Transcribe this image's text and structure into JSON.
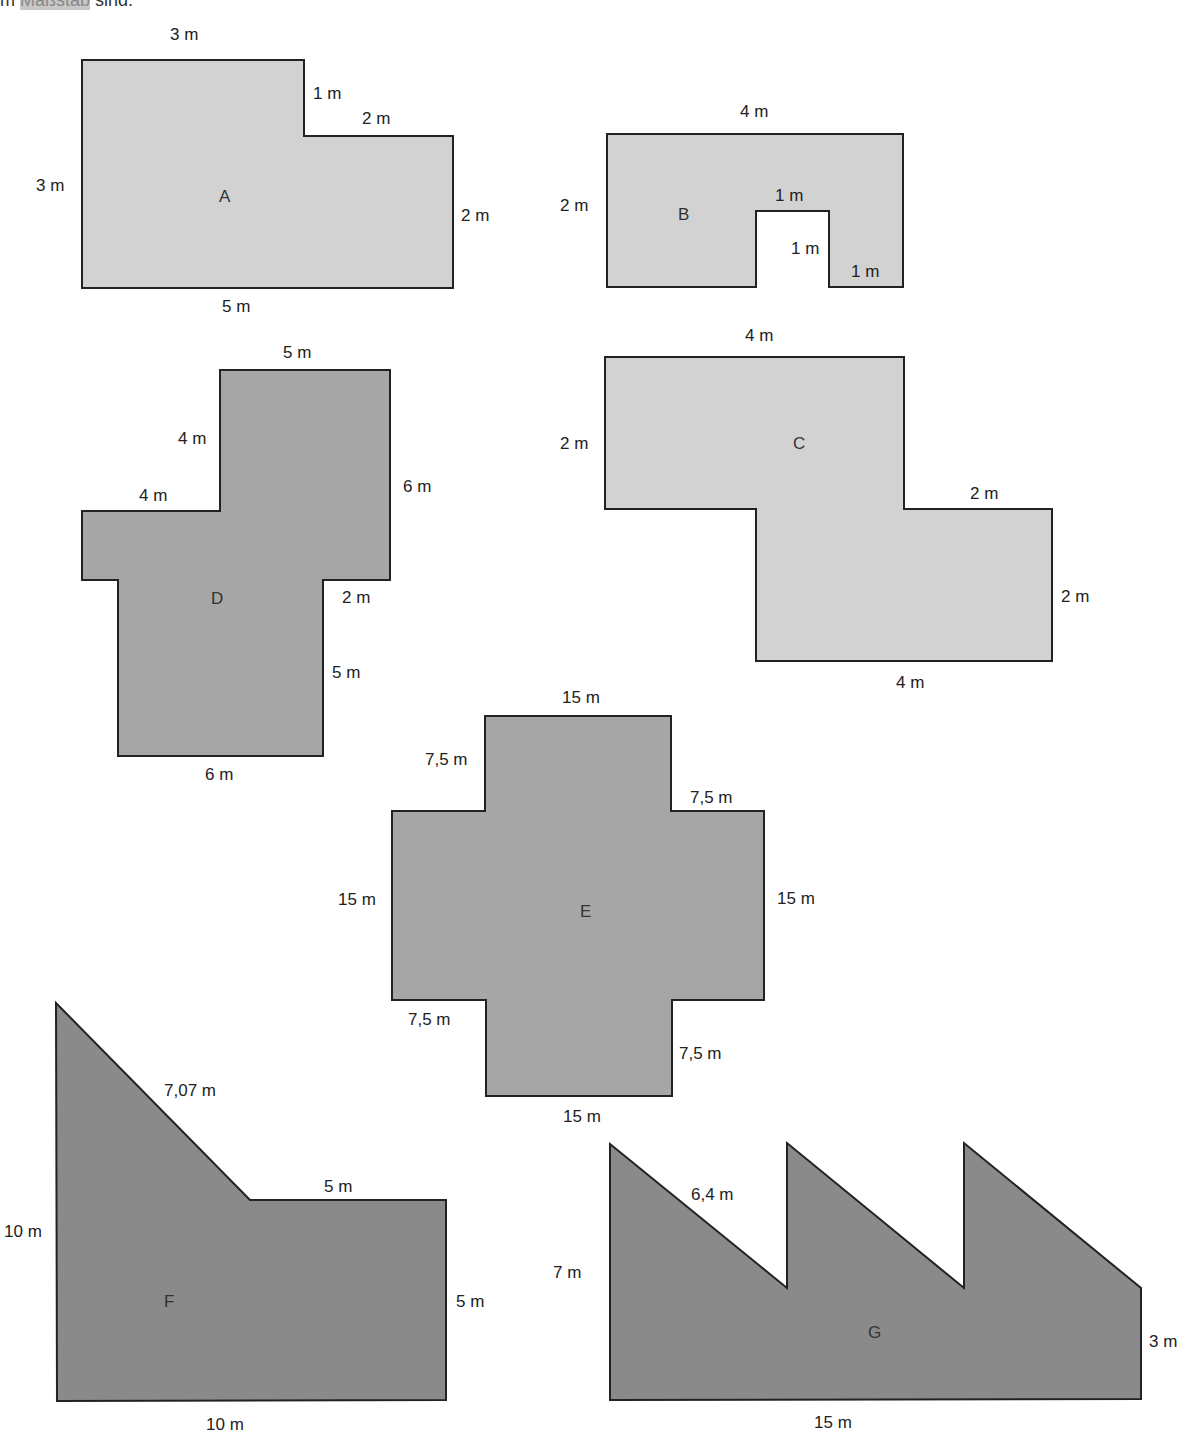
{
  "header": {
    "prefix": "m",
    "highlight": "Maßstab",
    "suffix": "sind."
  },
  "colors": {
    "light": "#d2d2d2",
    "medium": "#a6a6a6",
    "dark": "#8a8a8a",
    "stroke": "#222222"
  },
  "shapes": {
    "A": {
      "name": "A",
      "labels": {
        "top": "3 m",
        "step_vertical": "1 m",
        "step_horizontal": "2 m",
        "left": "3 m",
        "right": "2 m",
        "bottom": "5 m"
      }
    },
    "B": {
      "name": "B",
      "labels": {
        "top": "4 m",
        "left": "2 m",
        "notch_top": "1 m",
        "notch_side": "1 m",
        "bottom_right": "1 m"
      }
    },
    "C": {
      "name": "C",
      "labels": {
        "top": "4 m",
        "left": "2 m",
        "step_horizontal": "2 m",
        "right": "2 m",
        "bottom": "4 m"
      }
    },
    "D": {
      "name": "D",
      "labels": {
        "top": "5 m",
        "upper_left_vertical": "4 m",
        "left_horizontal": "4 m",
        "right": "6 m",
        "right_step": "2 m",
        "lower_right": "5 m",
        "bottom": "6 m"
      }
    },
    "E": {
      "name": "E",
      "labels": {
        "top": "15 m",
        "top_left": "7,5 m",
        "top_right": "7,5 m",
        "left": "15 m",
        "right": "15 m",
        "bottom_left": "7,5 m",
        "bottom_right": "7,5 m",
        "bottom": "15 m"
      }
    },
    "F": {
      "name": "F",
      "labels": {
        "diagonal": "7,07 m",
        "step_horizontal": "5 m",
        "left": "10 m",
        "right": "5 m",
        "bottom": "10 m"
      }
    },
    "G": {
      "name": "G",
      "labels": {
        "diagonal": "6,4 m",
        "left": "7 m",
        "right": "3 m",
        "bottom": "15 m"
      }
    }
  }
}
